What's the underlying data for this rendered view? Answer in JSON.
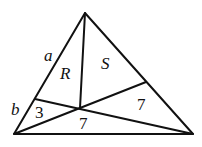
{
  "diagram": {
    "type": "triangle-cevians",
    "vertices": {
      "apex": [
        85,
        13
      ],
      "bottom_left": [
        14,
        134
      ],
      "bottom_right": [
        193,
        134
      ]
    },
    "points": {
      "interior": [
        80,
        108
      ],
      "left_side": [
        35,
        99
      ],
      "right_side": [
        146,
        82
      ]
    },
    "labels": {
      "a": "a",
      "b": "b",
      "R": "R",
      "S": "S",
      "area_left": "3",
      "area_bottom": "7",
      "area_right": "7"
    }
  }
}
